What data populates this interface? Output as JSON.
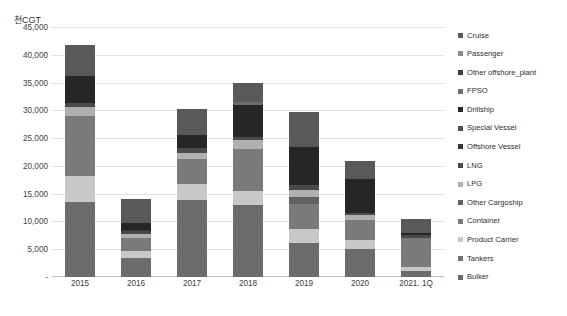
{
  "axis_unit_title": "천CGT",
  "legend": {
    "position": "right",
    "items": [
      {
        "label": "Cruise",
        "color": "#595959"
      },
      {
        "label": "Passenger",
        "color": "#8c8c8c"
      },
      {
        "label": "Other offshore_plant",
        "color": "#3f3f3f"
      },
      {
        "label": "FPSO",
        "color": "#6e6e6e"
      },
      {
        "label": "Drillship",
        "color": "#262626"
      },
      {
        "label": "Special Vessel",
        "color": "#4f4f4f"
      },
      {
        "label": "Offshore Vessel",
        "color": "#333333"
      },
      {
        "label": "LNG",
        "color": "#4a4a4a"
      },
      {
        "label": "LPG",
        "color": "#b0b0b0"
      },
      {
        "label": "Other Cargoship",
        "color": "#616161"
      },
      {
        "label": "Container",
        "color": "#7a7a7a"
      },
      {
        "label": "Product Carrier",
        "color": "#c8c8c8"
      },
      {
        "label": "Tankers",
        "color": "#707070"
      },
      {
        "label": "Bulker",
        "color": "#6b6b6b"
      }
    ]
  },
  "yaxis": {
    "ticks": [
      "45,000",
      "40,000",
      "35,000",
      "30,000",
      "25,000",
      "20,000",
      "15,000",
      "10,000",
      "5,000",
      "-"
    ],
    "values": [
      45000,
      40000,
      35000,
      30000,
      25000,
      20000,
      15000,
      10000,
      5000,
      0
    ],
    "min": 0,
    "max": 45000
  },
  "chart_data": {
    "type": "bar",
    "title": "",
    "subtitle": "",
    "xlabel": "",
    "ylabel": "천CGT",
    "ylim": [
      0,
      45000
    ],
    "grid": true,
    "stacked": true,
    "legend_position": "right",
    "categories": [
      "2015",
      "2016",
      "2017",
      "2018",
      "2019",
      "2020",
      "2021. 1Q"
    ],
    "totals": [
      41700,
      14000,
      30200,
      35000,
      29700,
      20900,
      10400
    ],
    "series": [
      {
        "name": "Bulker",
        "color": "#6b6b6b",
        "values": [
          13500,
          2900,
          13800,
          13000,
          6200,
          5100,
          1100
        ]
      },
      {
        "name": "Tankers",
        "color": "#707070",
        "values": [
          0,
          600,
          0,
          0,
          0,
          0,
          0
        ]
      },
      {
        "name": "Product Carrier",
        "color": "#c8c8c8",
        "values": [
          4600,
          1100,
          3000,
          2500,
          2400,
          1600,
          700
        ]
      },
      {
        "name": "Container",
        "color": "#7a7a7a",
        "values": [
          10900,
          2400,
          4500,
          7500,
          4600,
          3500,
          5300
        ]
      },
      {
        "name": "Other Cargoship",
        "color": "#616161",
        "values": [
          0,
          0,
          0,
          0,
          1200,
          0,
          0
        ]
      },
      {
        "name": "LPG",
        "color": "#b0b0b0",
        "values": [
          1600,
          700,
          1100,
          1600,
          1300,
          900,
          0
        ]
      },
      {
        "name": "LNG",
        "color": "#4a4a4a",
        "values": [
          700,
          500,
          900,
          600,
          900,
          400,
          400
        ]
      },
      {
        "name": "Offshore Vessel",
        "color": "#333333",
        "values": [
          0,
          300,
          0,
          0,
          0,
          0,
          0
        ]
      },
      {
        "name": "Special Vessel",
        "color": "#4f4f4f",
        "values": [
          0,
          0,
          0,
          0,
          0,
          0,
          0
        ]
      },
      {
        "name": "Drillship",
        "color": "#262626",
        "values": [
          4900,
          1300,
          2200,
          5700,
          6800,
          6200,
          400
        ]
      },
      {
        "name": "FPSO",
        "color": "#6e6e6e",
        "values": [
          0,
          0,
          0,
          700,
          0,
          0,
          0
        ]
      },
      {
        "name": "Other offshore_plant",
        "color": "#3f3f3f",
        "values": [
          0,
          0,
          0,
          0,
          0,
          0,
          0
        ]
      },
      {
        "name": "Passenger",
        "color": "#8c8c8c",
        "values": [
          0,
          0,
          0,
          0,
          0,
          0,
          0
        ]
      },
      {
        "name": "Cruise",
        "color": "#595959",
        "values": [
          5500,
          4200,
          4700,
          3400,
          6300,
          3200,
          2500
        ]
      }
    ]
  }
}
